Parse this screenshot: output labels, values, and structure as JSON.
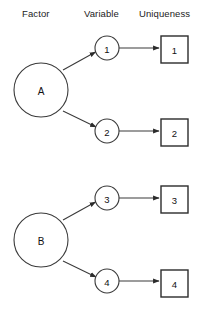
{
  "diagram": {
    "type": "factor-analysis-path-diagram",
    "headers": [
      {
        "id": "factor",
        "label": "Factor"
      },
      {
        "id": "variable",
        "label": "Variable"
      },
      {
        "id": "uniqueness",
        "label": "Uniqueness"
      }
    ],
    "factors": [
      {
        "id": "A",
        "label": "A",
        "cx": 41,
        "cy": 90,
        "r": 27
      },
      {
        "id": "B",
        "label": "B",
        "cx": 41,
        "cy": 240,
        "r": 27
      }
    ],
    "variables": [
      {
        "id": "v1",
        "label": "1",
        "cx": 107,
        "cy": 48,
        "r": 12,
        "factor": "A"
      },
      {
        "id": "v2",
        "label": "2",
        "cx": 107,
        "cy": 131,
        "r": 12,
        "factor": "A"
      },
      {
        "id": "v3",
        "label": "3",
        "cx": 107,
        "cy": 198,
        "r": 12,
        "factor": "B"
      },
      {
        "id": "v4",
        "label": "4",
        "cx": 107,
        "cy": 281,
        "r": 12,
        "factor": "B"
      }
    ],
    "uniquenesses": [
      {
        "id": "u1",
        "label": "1",
        "x": 161,
        "y": 36,
        "w": 27,
        "h": 27,
        "variable": "v1"
      },
      {
        "id": "u2",
        "label": "2",
        "x": 161,
        "y": 119,
        "w": 27,
        "h": 27,
        "variable": "v2"
      },
      {
        "id": "u3",
        "label": "3",
        "x": 161,
        "y": 186,
        "w": 27,
        "h": 27,
        "variable": "v3"
      },
      {
        "id": "u4",
        "label": "4",
        "x": 161,
        "y": 270,
        "w": 27,
        "h": 27,
        "variable": "v4"
      }
    ],
    "colors": {
      "background": "#ffffff",
      "stroke": "#3a3a3a",
      "box_stroke": "#2b2b2b",
      "text": "#111111"
    }
  }
}
